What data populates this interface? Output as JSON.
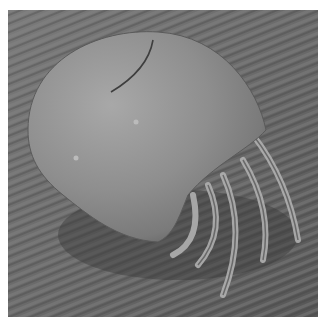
{
  "image": {
    "subject": "mite",
    "style": "grayscale scanning electron micrograph",
    "description": "Dome-shaped mite body with legs on the right, resting on a diagonally striated surface",
    "colors": {
      "background_border": "#ffffff",
      "surface_dark": "#4a4a4a",
      "surface_mid": "#727272",
      "surface_light": "#a0a0a0",
      "body_light": "#b4b4b4",
      "body_mid": "#8c8c8c",
      "body_shadow": "#5a5a5a"
    }
  }
}
